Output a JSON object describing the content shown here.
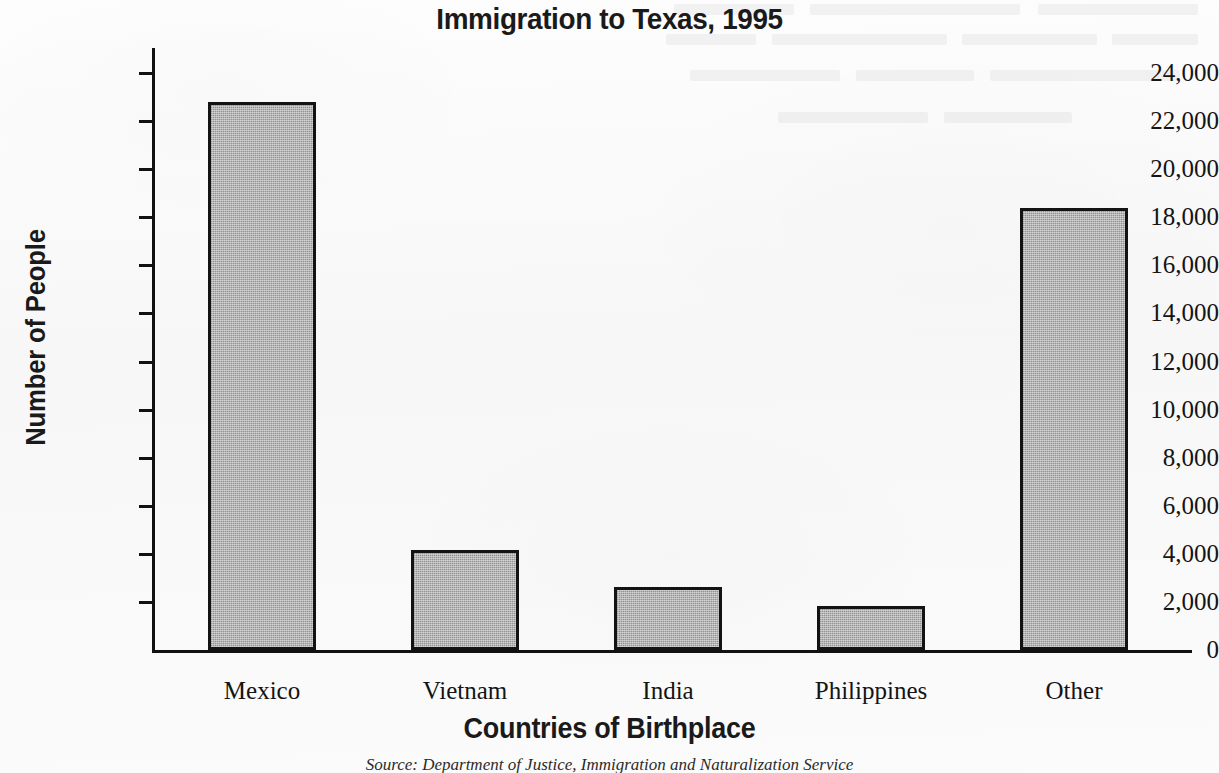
{
  "chart_data": {
    "type": "bar",
    "title": "Immigration to Texas, 1995",
    "xlabel": "Countries of Birthplace",
    "ylabel": "Number of People",
    "categories": [
      "Mexico",
      "Vietnam",
      "India",
      "Philippines",
      "Other"
    ],
    "values": [
      22800,
      4150,
      2600,
      1850,
      18400
    ],
    "ylim": [
      0,
      24000
    ],
    "ytick_step": 2000,
    "ytick_labels": [
      "24,000",
      "22,000",
      "20,000",
      "18,000",
      "16,000",
      "14,000",
      "12,000",
      "10,000",
      "8,000",
      "6,000",
      "4,000",
      "2,000",
      "0"
    ],
    "ytick_values": [
      24000,
      22000,
      20000,
      18000,
      16000,
      14000,
      12000,
      10000,
      8000,
      6000,
      4000,
      2000,
      0
    ],
    "grid": false,
    "legend": null,
    "bar_fill_color": "#a9a9a9",
    "bar_edge_color": "#131313",
    "axis_color": "#111111",
    "background_color": "#fafafa",
    "annotations": [
      "Source: Department of Justice, Immigration and Naturalization Service"
    ]
  },
  "source_note": "Source: Department of Justice, Immigration and Naturalization Service"
}
